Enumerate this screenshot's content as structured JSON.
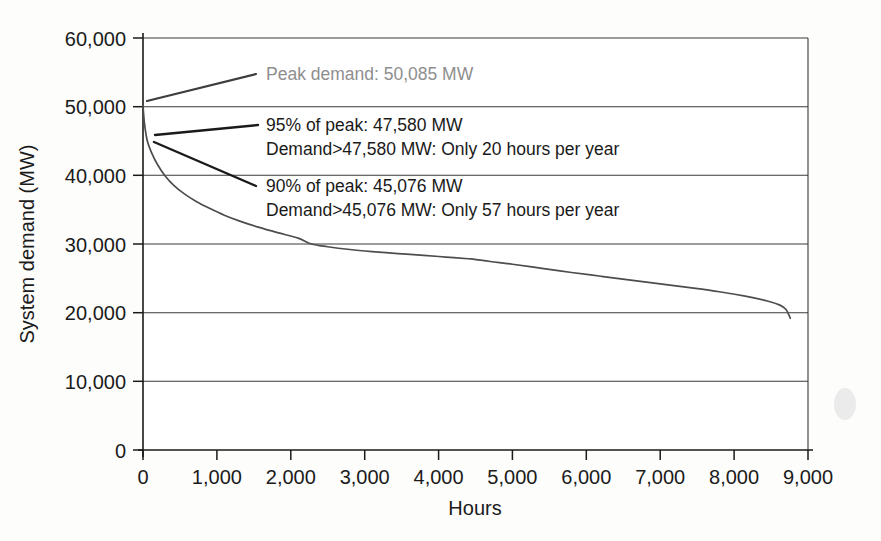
{
  "chart_data": {
    "type": "line",
    "title": "",
    "xlabel": "Hours",
    "ylabel": "System demand (MW)",
    "xlim": [
      0,
      9000
    ],
    "ylim": [
      0,
      60000
    ],
    "xticks": [
      0,
      1000,
      2000,
      3000,
      4000,
      5000,
      6000,
      7000,
      8000,
      9000
    ],
    "xtick_labels": [
      "0",
      "1,000",
      "2,000",
      "3,000",
      "4,000",
      "5,000",
      "6,000",
      "7,000",
      "8,000",
      "9,000"
    ],
    "yticks": [
      0,
      10000,
      20000,
      30000,
      40000,
      50000,
      60000
    ],
    "ytick_labels": [
      "0",
      "10,000",
      "20,000",
      "30,000",
      "40,000",
      "50,000",
      "60,000"
    ],
    "grid": "horizontal",
    "legend": "none",
    "series": [
      {
        "name": "Load duration curve",
        "color": "#4d4d4d",
        "x": [
          0,
          20,
          57,
          120,
          200,
          300,
          420,
          560,
          720,
          900,
          1100,
          1320,
          1560,
          1820,
          2100,
          2280,
          2500,
          2800,
          3100,
          3450,
          3800,
          4100,
          4400,
          4470,
          4700,
          5000,
          5400,
          5800,
          6200,
          6600,
          7000,
          7400,
          7800,
          8150,
          8450,
          8620,
          8700,
          8740,
          8760
        ],
        "y": [
          50085,
          47580,
          45076,
          43200,
          41500,
          39900,
          38500,
          37300,
          36200,
          35200,
          34200,
          33300,
          32450,
          31650,
          30850,
          30000,
          29600,
          29200,
          28900,
          28600,
          28350,
          28100,
          27850,
          27800,
          27450,
          27050,
          26450,
          25850,
          25300,
          24750,
          24200,
          23650,
          23050,
          22400,
          21700,
          21100,
          20500,
          19700,
          19200
        ]
      }
    ],
    "annotations": [
      {
        "id": "peak",
        "lines": [
          "Peak demand: 50,085 MW"
        ],
        "value": 50085,
        "style": "muted",
        "anchor_hours": 0
      },
      {
        "id": "p95",
        "lines": [
          "95% of peak: 47,580 MW",
          "Demand>47,580 MW: Only 20 hours per year"
        ],
        "value": 47580,
        "style": "normal",
        "anchor_hours": 20
      },
      {
        "id": "p90",
        "lines": [
          "90% of peak: 45,076 MW",
          "Demand>45,076 MW: Only 57 hours per year"
        ],
        "value": 45076,
        "style": "normal",
        "anchor_hours": 57
      }
    ]
  },
  "colors": {
    "curve": "#4d4d4d",
    "grid": "#3a3a3a",
    "axis": "#1a1a1a",
    "text": "#1a1a1a",
    "muted_text": "#8e8e8e",
    "background": "#fdfdfc"
  }
}
